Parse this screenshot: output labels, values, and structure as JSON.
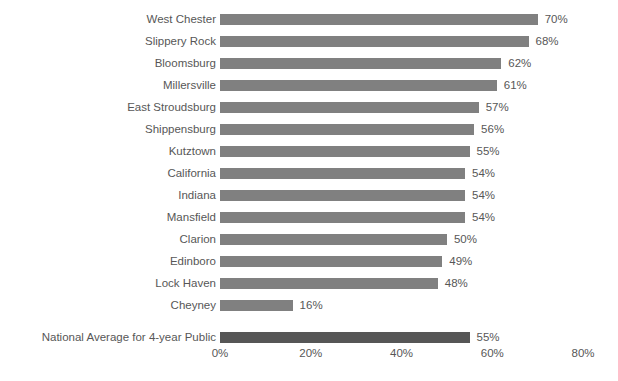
{
  "chart_data": {
    "type": "bar",
    "orientation": "horizontal",
    "title": "",
    "subtitle": "",
    "xlabel": "",
    "ylabel": "",
    "xlim": [
      0,
      80
    ],
    "grid": false,
    "legend": null,
    "value_suffix": "%",
    "tick_labels": [
      "0%",
      "20%",
      "40%",
      "60%",
      "80%"
    ],
    "tick_values": [
      0,
      20,
      40,
      60,
      80
    ],
    "colors": {
      "bar": "#808080",
      "bar_highlight": "#565656",
      "text": "#575757",
      "background": "#ffffff"
    },
    "categories": [
      "West Chester",
      "Slippery Rock",
      "Bloomsburg",
      "Millersville",
      "East Stroudsburg",
      "Shippensburg",
      "Kutztown",
      "California",
      "Indiana",
      "Mansfield",
      "Clarion",
      "Edinboro",
      "Lock Haven",
      "Cheyney",
      "National Average for 4-year Public"
    ],
    "values": [
      70,
      68,
      62,
      61,
      57,
      56,
      55,
      54,
      54,
      54,
      50,
      49,
      48,
      16,
      55
    ],
    "data_labels": [
      "70%",
      "68%",
      "62%",
      "61%",
      "57%",
      "56%",
      "55%",
      "54%",
      "54%",
      "54%",
      "50%",
      "49%",
      "48%",
      "16%",
      "55%"
    ],
    "highlight_index": 14,
    "bars": [
      {
        "label": "West Chester",
        "value": 70,
        "data_label": "70%",
        "highlight": false
      },
      {
        "label": "Slippery Rock",
        "value": 68,
        "data_label": "68%",
        "highlight": false
      },
      {
        "label": "Bloomsburg",
        "value": 62,
        "data_label": "62%",
        "highlight": false
      },
      {
        "label": "Millersville",
        "value": 61,
        "data_label": "61%",
        "highlight": false
      },
      {
        "label": "East Stroudsburg",
        "value": 57,
        "data_label": "57%",
        "highlight": false
      },
      {
        "label": "Shippensburg",
        "value": 56,
        "data_label": "56%",
        "highlight": false
      },
      {
        "label": "Kutztown",
        "value": 55,
        "data_label": "55%",
        "highlight": false
      },
      {
        "label": "California",
        "value": 54,
        "data_label": "54%",
        "highlight": false
      },
      {
        "label": "Indiana",
        "value": 54,
        "data_label": "54%",
        "highlight": false
      },
      {
        "label": "Mansfield",
        "value": 54,
        "data_label": "54%",
        "highlight": false
      },
      {
        "label": "Clarion",
        "value": 50,
        "data_label": "50%",
        "highlight": false
      },
      {
        "label": "Edinboro",
        "value": 49,
        "data_label": "49%",
        "highlight": false
      },
      {
        "label": "Lock Haven",
        "value": 48,
        "data_label": "48%",
        "highlight": false
      },
      {
        "label": "Cheyney",
        "value": 16,
        "data_label": "16%",
        "highlight": false
      },
      {
        "label": "National Average for 4-year Public",
        "value": 55,
        "data_label": "55%",
        "highlight": true
      }
    ]
  }
}
